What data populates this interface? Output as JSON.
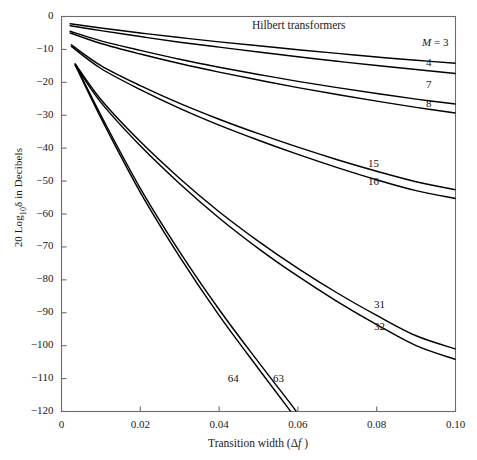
{
  "chart_data": {
    "type": "line",
    "title": "Hilbert transformers",
    "xlabel": "Transition width (Δf )",
    "ylabel": "20 Log₁₀δ in Decibels",
    "xlim": [
      0,
      0.1
    ],
    "ylim": [
      -120,
      0
    ],
    "xticks": [
      "0",
      "0.02",
      "0.04",
      "0.06",
      "0.08",
      "0.10"
    ],
    "xtick_values": [
      0,
      0.02,
      0.04,
      0.06,
      0.08,
      0.1
    ],
    "yticks": [
      "0",
      "−10",
      "−20",
      "−30",
      "−40",
      "−50",
      "−60",
      "−70",
      "−80",
      "−90",
      "−100",
      "−110",
      "−120"
    ],
    "ytick_values": [
      0,
      -10,
      -20,
      -30,
      -40,
      -50,
      -60,
      -70,
      -80,
      -90,
      -100,
      -110,
      -120
    ],
    "grid": false,
    "legend_position": "inline-right",
    "series": [
      {
        "name": "M = 3",
        "label": "M = 3",
        "label_x": 0.0915,
        "label_y": -8.5,
        "points": [
          [
            0.0022,
            -2.2
          ],
          [
            0.01,
            -3.5
          ],
          [
            0.02,
            -5.0
          ],
          [
            0.03,
            -6.4
          ],
          [
            0.04,
            -7.7
          ],
          [
            0.05,
            -8.9
          ],
          [
            0.06,
            -10.1
          ],
          [
            0.07,
            -11.2
          ],
          [
            0.08,
            -12.3
          ],
          [
            0.09,
            -13.3
          ],
          [
            0.1,
            -14.2
          ]
        ]
      },
      {
        "name": "4",
        "label": "4",
        "label_x": 0.0925,
        "label_y": -14.5,
        "points": [
          [
            0.0022,
            -2.8
          ],
          [
            0.01,
            -4.3
          ],
          [
            0.02,
            -6.1
          ],
          [
            0.03,
            -7.8
          ],
          [
            0.04,
            -9.3
          ],
          [
            0.05,
            -10.8
          ],
          [
            0.06,
            -12.2
          ],
          [
            0.07,
            -13.6
          ],
          [
            0.08,
            -14.9
          ],
          [
            0.09,
            -16.1
          ],
          [
            0.1,
            -17.3
          ]
        ]
      },
      {
        "name": "7",
        "label": "7",
        "label_x": 0.0925,
        "label_y": -21.0,
        "points": [
          [
            0.0022,
            -4.5
          ],
          [
            0.01,
            -7.4
          ],
          [
            0.02,
            -10.3
          ],
          [
            0.03,
            -13.0
          ],
          [
            0.04,
            -15.4
          ],
          [
            0.05,
            -17.6
          ],
          [
            0.06,
            -19.7
          ],
          [
            0.07,
            -21.6
          ],
          [
            0.08,
            -23.4
          ],
          [
            0.09,
            -25.1
          ],
          [
            0.1,
            -26.6
          ]
        ]
      },
      {
        "name": "8",
        "label": "8",
        "label_x": 0.0925,
        "label_y": -27.0,
        "points": [
          [
            0.0022,
            -5.0
          ],
          [
            0.01,
            -8.2
          ],
          [
            0.02,
            -11.4
          ],
          [
            0.03,
            -14.3
          ],
          [
            0.04,
            -16.9
          ],
          [
            0.05,
            -19.3
          ],
          [
            0.06,
            -21.6
          ],
          [
            0.07,
            -23.7
          ],
          [
            0.08,
            -25.7
          ],
          [
            0.09,
            -27.6
          ],
          [
            0.1,
            -29.3
          ]
        ]
      },
      {
        "name": "15",
        "label": "15",
        "label_x": 0.0778,
        "label_y": -45.0,
        "points": [
          [
            0.0025,
            -8.6
          ],
          [
            0.01,
            -14.9
          ],
          [
            0.02,
            -21.0
          ],
          [
            0.03,
            -26.4
          ],
          [
            0.04,
            -31.2
          ],
          [
            0.05,
            -35.6
          ],
          [
            0.06,
            -39.7
          ],
          [
            0.07,
            -43.5
          ],
          [
            0.08,
            -47.0
          ],
          [
            0.09,
            -50.2
          ],
          [
            0.1,
            -52.6
          ]
        ]
      },
      {
        "name": "16",
        "label": "16",
        "label_x": 0.0778,
        "label_y": -50.5,
        "points": [
          [
            0.0025,
            -9.1
          ],
          [
            0.01,
            -15.8
          ],
          [
            0.02,
            -22.2
          ],
          [
            0.03,
            -27.9
          ],
          [
            0.04,
            -33.0
          ],
          [
            0.05,
            -37.6
          ],
          [
            0.06,
            -41.9
          ],
          [
            0.07,
            -45.9
          ],
          [
            0.08,
            -49.6
          ],
          [
            0.09,
            -52.9
          ],
          [
            0.1,
            -55.3
          ]
        ]
      },
      {
        "name": "31",
        "label": "31",
        "label_x": 0.0793,
        "label_y": -88.0,
        "points": [
          [
            0.0035,
            -14.4
          ],
          [
            0.01,
            -25.2
          ],
          [
            0.02,
            -38.0
          ],
          [
            0.03,
            -49.2
          ],
          [
            0.04,
            -59.3
          ],
          [
            0.05,
            -68.3
          ],
          [
            0.06,
            -76.5
          ],
          [
            0.07,
            -84.0
          ],
          [
            0.08,
            -90.8
          ],
          [
            0.09,
            -97.0
          ],
          [
            0.1,
            -101.0
          ]
        ]
      },
      {
        "name": "32",
        "label": "32",
        "label_x": 0.0793,
        "label_y": -94.5,
        "points": [
          [
            0.0035,
            -14.8
          ],
          [
            0.01,
            -26.1
          ],
          [
            0.02,
            -39.3
          ],
          [
            0.03,
            -50.8
          ],
          [
            0.04,
            -61.2
          ],
          [
            0.05,
            -70.5
          ],
          [
            0.06,
            -78.9
          ],
          [
            0.07,
            -86.6
          ],
          [
            0.08,
            -93.6
          ],
          [
            0.09,
            -100.0
          ],
          [
            0.1,
            -104.2
          ]
        ]
      },
      {
        "name": "63",
        "label": "63",
        "label_x": 0.0537,
        "label_y": -110.5,
        "points": [
          [
            0.0035,
            -14.5
          ],
          [
            0.01,
            -30.0
          ],
          [
            0.02,
            -52.2
          ],
          [
            0.03,
            -71.5
          ],
          [
            0.04,
            -89.0
          ],
          [
            0.05,
            -105.0
          ],
          [
            0.0585,
            -118.2
          ],
          [
            0.0595,
            -120.0
          ]
        ]
      },
      {
        "name": "64",
        "label": "64",
        "label_x": 0.0422,
        "label_y": -110.5,
        "points": [
          [
            0.0035,
            -14.8
          ],
          [
            0.01,
            -30.8
          ],
          [
            0.02,
            -53.4
          ],
          [
            0.03,
            -73.0
          ],
          [
            0.04,
            -90.8
          ],
          [
            0.05,
            -107.0
          ],
          [
            0.0573,
            -118.6
          ],
          [
            0.0582,
            -120.0
          ]
        ]
      }
    ]
  },
  "axis": {
    "y_label_prefix": "20 Log",
    "y_label_sub": "10",
    "y_label_delta": "δ",
    "y_label_suffix": " in Decibels",
    "x_label_main": "Transition width (",
    "x_label_delta": "Δ",
    "x_label_f": "f",
    "x_label_close": " )"
  },
  "colors": {
    "curve": "#000000",
    "axis": "#6b6b6b",
    "text": "#1a1a1a",
    "background": "#ffffff"
  }
}
